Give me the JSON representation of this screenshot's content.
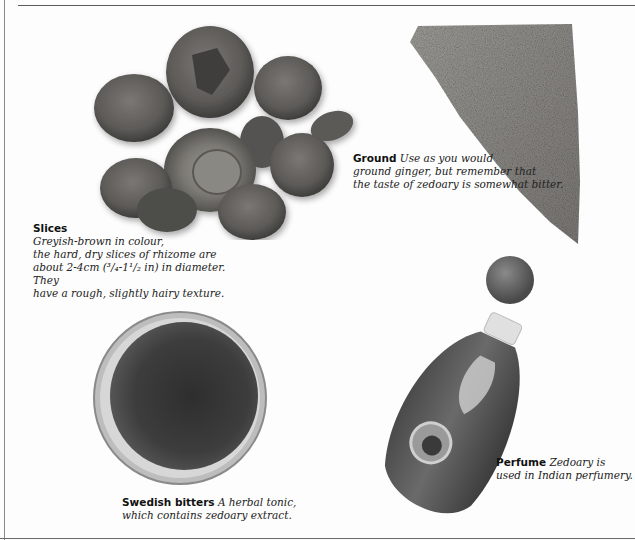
{
  "page": {
    "subject": "Zedoary",
    "panels": [
      {
        "id": "slices",
        "title": "Slices",
        "lines": [
          "Greyish-brown in colour,",
          "the hard, dry slices of rhizome are",
          "about 2-4cm (³/₄-1¹/₂ in) in diameter. They",
          "have a rough, slightly hairy texture."
        ],
        "image": "dried-rhizome-slices"
      },
      {
        "id": "ground",
        "title": "Ground",
        "lines": [
          "Use as you would",
          "ground ginger, but remember that",
          "the taste of zedoary is somewhat bitter."
        ],
        "image": "ground-powder-heap"
      },
      {
        "id": "swedish-bitters",
        "title": "Swedish bitters",
        "lines": [
          "A herbal tonic,",
          "which contains zedoary extract."
        ],
        "image": "dish-of-liquid-tonic"
      },
      {
        "id": "perfume",
        "title": "Perfume",
        "lines": [
          "Zedoary is",
          "used in Indian perfumery."
        ],
        "image": "perfume-bottle-with-stopper"
      }
    ],
    "colors": {
      "slice_dark": "#4a4a48",
      "slice_mid": "#6e6e6a",
      "powder": "#8c8a86",
      "liquid": "#3c3c3c",
      "bottle": "#5a5a5a",
      "rule": "#5a5a5a"
    }
  }
}
